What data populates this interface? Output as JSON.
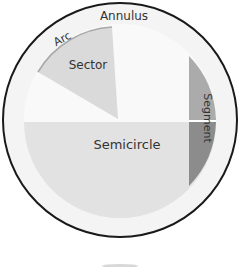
{
  "diagram": {
    "labels": {
      "annulus": "Annulus",
      "arc": "Arc",
      "sector": "Sector",
      "semicircle": "Semicircle",
      "segment": "Segment"
    },
    "colors": {
      "outline": "#1a1a1a",
      "annulus": "#f4f4f4",
      "inner_disc": "#f9f9f9",
      "sector": "#dadada",
      "arc": "#a9a9a9",
      "semicircle": "#e2e2e2",
      "segment_upper": "#ababab",
      "segment_lower": "#8c8c8c",
      "divider": "#ffffff",
      "text": "#333333"
    }
  }
}
